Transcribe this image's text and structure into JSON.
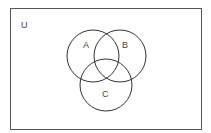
{
  "diagram": {
    "type": "venn",
    "universe": {
      "label": "U",
      "x": 10,
      "y": 8,
      "width": 191,
      "height": 121,
      "label_pos": {
        "x": 21,
        "y": 28
      }
    },
    "sets": [
      {
        "label": "A",
        "cx": 93,
        "cy": 56,
        "r": 26,
        "label_pos": {
          "x": 83,
          "y": 48
        }
      },
      {
        "label": "B",
        "cx": 120,
        "cy": 56,
        "r": 26,
        "label_pos": {
          "x": 122,
          "y": 48
        }
      },
      {
        "label": "C",
        "cx": 106,
        "cy": 85,
        "r": 26,
        "label_pos": {
          "x": 102,
          "y": 97
        }
      }
    ],
    "stroke_color": "#333333",
    "label_color": "#444444"
  }
}
